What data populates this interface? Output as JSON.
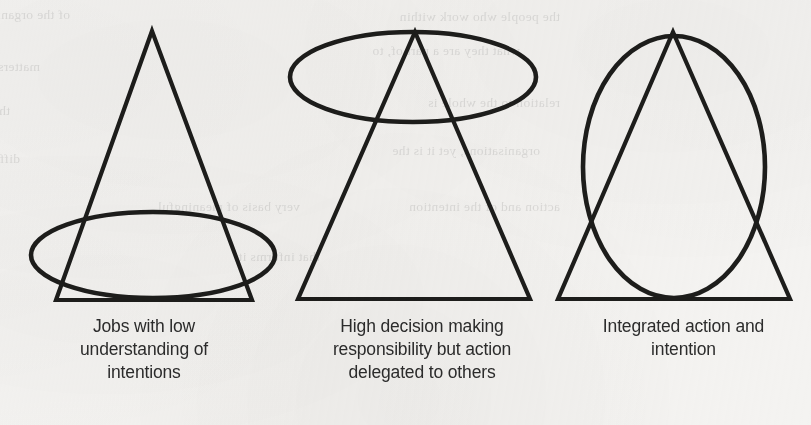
{
  "figure": {
    "background_color": "#f4f3f1",
    "stroke_color": "#1d1d1b",
    "caption_color": "#2c2c2c",
    "panels": [
      {
        "id": "panel-low-understanding",
        "shape_labels": [
          "triangle",
          "ellipse"
        ],
        "caption_lines": [
          "Jobs with low",
          "understanding of",
          "intentions"
        ]
      },
      {
        "id": "panel-delegated-action",
        "shape_labels": [
          "triangle",
          "ellipse"
        ],
        "caption_lines": [
          "High decision making",
          "responsibility but action",
          "delegated to others"
        ]
      },
      {
        "id": "panel-integrated",
        "shape_labels": [
          "triangle",
          "ellipse"
        ],
        "caption_lines": [
          "Integrated action and",
          "intention"
        ]
      }
    ]
  },
  "bleed_text": {
    "note": "faint show-through text from the reverse side of the scanned page",
    "lines": [
      "of the organisation and its",
      "the people who work within",
      "matters of scale. A sense of",
      "what they are a part of, to",
      "that the work they do has",
      "relation to the whole is",
      "difficult to achieve in large",
      "organisations, yet it is the",
      "very basis of meaningful",
      "action and of the intention",
      "that informs it."
    ]
  }
}
